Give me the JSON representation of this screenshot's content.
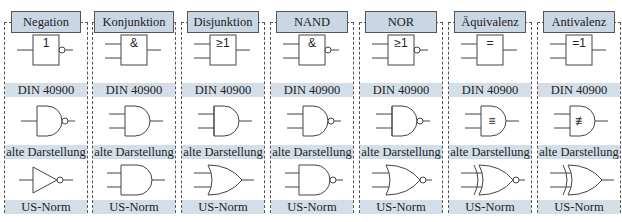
{
  "columns": [
    {
      "title": "Negation",
      "din_symbol": "1",
      "din_inputs": 1,
      "negated": true,
      "old_mark": "",
      "us_type": "not"
    },
    {
      "title": "Konjunktion",
      "din_symbol": "&",
      "din_inputs": 2,
      "negated": false,
      "old_mark": "",
      "us_type": "and"
    },
    {
      "title": "Disjunktion",
      "din_symbol": "≥1",
      "din_inputs": 2,
      "negated": false,
      "old_mark": "",
      "us_type": "or"
    },
    {
      "title": "NAND",
      "din_symbol": "&",
      "din_inputs": 2,
      "negated": true,
      "old_mark": "",
      "us_type": "nand"
    },
    {
      "title": "NOR",
      "din_symbol": "≥1",
      "din_inputs": 2,
      "negated": true,
      "old_mark": "",
      "us_type": "nor"
    },
    {
      "title": "Äquivalenz",
      "din_symbol": "=",
      "din_inputs": 2,
      "negated": false,
      "old_mark": "≡",
      "us_type": "xnor"
    },
    {
      "title": "Antivalenz",
      "din_symbol": "=1",
      "din_inputs": 2,
      "negated": false,
      "old_mark": "≢",
      "us_type": "xor"
    }
  ],
  "labels": {
    "din": "DIN 40900",
    "old": "alte Darstellung",
    "us": "US-Norm"
  },
  "colors": {
    "header_bg": "#c9d6e3",
    "band_bg": "#d3dee8",
    "line": "#444444"
  }
}
